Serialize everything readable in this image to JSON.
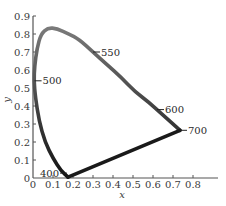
{
  "chart_data": {
    "type": "line",
    "title": "",
    "xlabel": "x",
    "ylabel": "y",
    "xlim": [
      0,
      0.9
    ],
    "ylim": [
      0,
      0.9
    ],
    "grid": false,
    "legend": null,
    "x_ticks": [
      "0",
      "0.1",
      "0.2",
      "0.3",
      "0.4",
      "0.5",
      "0.6",
      "0.7",
      "0.8"
    ],
    "y_ticks": [
      "0",
      "0.1",
      "0.2",
      "0.3",
      "0.4",
      "0.5",
      "0.6",
      "0.7",
      "0.8",
      "0.9"
    ],
    "series": [
      {
        "name": "spectral locus",
        "x": [
          0.175,
          0.14,
          0.1,
          0.06,
          0.03,
          0.012,
          0.005,
          0.008,
          0.02,
          0.04,
          0.075,
          0.12,
          0.18,
          0.23,
          0.3,
          0.37,
          0.44,
          0.51,
          0.58,
          0.64,
          0.7,
          0.735
        ],
        "y": [
          0.005,
          0.04,
          0.11,
          0.2,
          0.32,
          0.45,
          0.54,
          0.62,
          0.72,
          0.8,
          0.835,
          0.83,
          0.8,
          0.77,
          0.7,
          0.63,
          0.56,
          0.48,
          0.42,
          0.36,
          0.3,
          0.265
        ]
      },
      {
        "name": "line of purples",
        "x": [
          0.735,
          0.175
        ],
        "y": [
          0.265,
          0.005
        ]
      }
    ],
    "annotations": [
      {
        "text": "400",
        "x": 0.175,
        "y": 0.005,
        "side": "left"
      },
      {
        "text": "500",
        "x": 0.008,
        "y": 0.54,
        "side": "right"
      },
      {
        "text": "550",
        "x": 0.3,
        "y": 0.7,
        "side": "right"
      },
      {
        "text": "600",
        "x": 0.62,
        "y": 0.38,
        "side": "right"
      },
      {
        "text": "700",
        "x": 0.735,
        "y": 0.265,
        "side": "right"
      }
    ]
  },
  "labels": {
    "x_axis": "x",
    "y_axis": "y"
  },
  "colors": {
    "curve_top": "#7a7a7a",
    "curve_bottom": "#1a1a1a",
    "axis": "#555555"
  }
}
